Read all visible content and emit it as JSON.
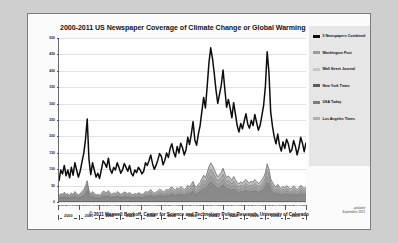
{
  "figure": {
    "title": "2000-2011 US Newspaper Coverage of Climate Change or Global Warming",
    "credit": "© 2011 Maxwell Boykoff, Center for Science and Technology Policy Research, University of Colorado",
    "updated_line1": "updated",
    "updated_line2": "September 2011"
  },
  "legend": {
    "items": [
      {
        "label": "5 Newspapers Combined",
        "color": "#0d0d0d"
      },
      {
        "label": "Washington Post",
        "color": "#9a9a9a"
      },
      {
        "label": "Wall Street Journal",
        "color": "#c8c8c8"
      },
      {
        "label": "New York Times",
        "color": "#5c5c5c"
      },
      {
        "label": "USA Today",
        "color": "#7e7e7e"
      },
      {
        "label": "Los Angeles Times",
        "color": "#b0b0b0"
      }
    ]
  },
  "chart_data": {
    "type": "line",
    "title": "2000-2011 US Newspaper Coverage of Climate Change or Global Warming",
    "xlabel": "",
    "ylabel": "Number of Articles",
    "ylim": [
      0,
      500
    ],
    "yticks": [
      0,
      50,
      100,
      150,
      200,
      250,
      300,
      350,
      400,
      450,
      500
    ],
    "grid": true,
    "legend_position": "right",
    "years": [
      "2000",
      "2001",
      "2002",
      "2003",
      "2004",
      "2005",
      "2006",
      "2007",
      "2008",
      "2009",
      "2010",
      "2011"
    ],
    "month_ticks": [
      "J",
      "F",
      "M",
      "A",
      "M",
      "J",
      "J",
      "A",
      "S",
      "O",
      "N",
      "D"
    ],
    "x_note": "Monthly observations, January 2000 through September 2011",
    "series": [
      {
        "name": "5 Newspapers Combined",
        "color": "#0d0d0d",
        "values": [
          62,
          96,
          84,
          110,
          78,
          96,
          72,
          104,
          80,
          118,
          96,
          74,
          92,
          120,
          146,
          188,
          252,
          128,
          82,
          118,
          96,
          74,
          86,
          70,
          96,
          124,
          116,
          104,
          132,
          98,
          86,
          104,
          96,
          118,
          104,
          86,
          96,
          116,
          104,
          92,
          110,
          86,
          78,
          96,
          88,
          104,
          96,
          84,
          92,
          118,
          110,
          124,
          142,
          116,
          98,
          110,
          126,
          146,
          138,
          112,
          126,
          148,
          134,
          162,
          176,
          150,
          136,
          168,
          148,
          178,
          164,
          142,
          158,
          196,
          174,
          206,
          244,
          188,
          172,
          206,
          232,
          276,
          318,
          286,
          352,
          424,
          470,
          438,
          392,
          340,
          300,
          328,
          356,
          402,
          344,
          288,
          312,
          286,
          256,
          302,
          268,
          232,
          212,
          238,
          222,
          246,
          268,
          236,
          224,
          248,
          232,
          266,
          242,
          218,
          232,
          262,
          294,
          352,
          458,
          396,
          274,
          230,
          198,
          176,
          206,
          172,
          154,
          182,
          162,
          190,
          176,
          150,
          158,
          186,
          168,
          142,
          164,
          196,
          178,
          152,
          180
        ]
      },
      {
        "name": "Washington Post",
        "color": "#9a9a9a",
        "values": [
          14,
          20,
          18,
          24,
          16,
          20,
          15,
          22,
          17,
          25,
          20,
          16,
          19,
          25,
          30,
          39,
          52,
          27,
          17,
          25,
          20,
          16,
          18,
          15,
          20,
          26,
          24,
          22,
          27,
          20,
          18,
          20,
          20,
          24,
          22,
          18,
          20,
          24,
          22,
          19,
          23,
          18,
          16,
          20,
          18,
          22,
          20,
          17,
          19,
          24,
          23,
          26,
          29,
          24,
          20,
          23,
          26,
          30,
          28,
          23,
          26,
          31,
          28,
          34,
          36,
          31,
          28,
          35,
          31,
          37,
          34,
          29,
          33,
          41,
          36,
          43,
          51,
          39,
          36,
          43,
          48,
          57,
          66,
          59,
          73,
          88,
          97,
          91,
          81,
          70,
          62,
          68,
          74,
          83,
          71,
          60,
          65,
          59,
          53,
          62,
          55,
          48,
          44,
          49,
          46,
          51,
          55,
          49,
          46,
          51,
          48,
          55,
          50,
          45,
          48,
          54,
          61,
          73,
          95,
          82,
          57,
          48,
          41,
          36,
          43,
          36,
          32,
          38,
          34,
          39,
          36,
          31,
          33,
          38,
          35,
          29,
          34,
          41,
          37,
          31,
          37
        ]
      },
      {
        "name": "Wall Street Journal",
        "color": "#c8c8c8",
        "values": [
          6,
          9,
          8,
          11,
          7,
          9,
          7,
          10,
          8,
          11,
          9,
          7,
          9,
          11,
          14,
          18,
          24,
          12,
          8,
          11,
          9,
          7,
          8,
          7,
          9,
          12,
          11,
          10,
          12,
          9,
          8,
          10,
          9,
          11,
          10,
          8,
          9,
          11,
          10,
          9,
          10,
          8,
          7,
          9,
          8,
          10,
          9,
          8,
          9,
          11,
          10,
          12,
          13,
          11,
          9,
          10,
          12,
          14,
          13,
          11,
          12,
          14,
          13,
          15,
          17,
          14,
          13,
          16,
          14,
          17,
          16,
          13,
          15,
          19,
          16,
          20,
          23,
          18,
          16,
          20,
          22,
          26,
          30,
          27,
          33,
          40,
          45,
          41,
          37,
          32,
          28,
          31,
          34,
          38,
          33,
          27,
          30,
          27,
          24,
          28,
          25,
          22,
          20,
          22,
          21,
          23,
          25,
          22,
          21,
          23,
          22,
          25,
          23,
          21,
          22,
          25,
          28,
          33,
          43,
          37,
          26,
          22,
          19,
          17,
          19,
          16,
          15,
          17,
          15,
          18,
          17,
          14,
          15,
          17,
          16,
          13,
          15,
          18,
          17,
          14,
          17
        ]
      },
      {
        "name": "New York Times",
        "color": "#5c5c5c",
        "values": [
          16,
          24,
          21,
          28,
          20,
          24,
          18,
          26,
          20,
          30,
          24,
          19,
          23,
          30,
          36,
          47,
          63,
          32,
          21,
          30,
          24,
          19,
          22,
          18,
          24,
          31,
          29,
          26,
          33,
          25,
          22,
          26,
          24,
          30,
          26,
          22,
          24,
          29,
          26,
          23,
          28,
          22,
          20,
          24,
          22,
          26,
          24,
          21,
          23,
          30,
          28,
          31,
          36,
          29,
          25,
          28,
          32,
          37,
          35,
          28,
          32,
          37,
          34,
          41,
          44,
          38,
          34,
          42,
          37,
          45,
          41,
          36,
          40,
          49,
          44,
          52,
          61,
          47,
          43,
          52,
          58,
          69,
          80,
          72,
          88,
          106,
          118,
          110,
          98,
          85,
          75,
          82,
          89,
          101,
          86,
          72,
          78,
          72,
          64,
          76,
          67,
          58,
          53,
          60,
          56,
          62,
          67,
          59,
          56,
          62,
          58,
          67,
          61,
          55,
          58,
          66,
          74,
          88,
          115,
          99,
          69,
          58,
          50,
          44,
          52,
          43,
          39,
          46,
          41,
          48,
          44,
          38,
          40,
          47,
          42,
          36,
          41,
          49,
          45,
          38,
          45
        ]
      },
      {
        "name": "USA Today",
        "color": "#7e7e7e",
        "values": [
          8,
          12,
          11,
          14,
          10,
          12,
          9,
          13,
          10,
          15,
          12,
          9,
          12,
          15,
          18,
          24,
          32,
          16,
          10,
          15,
          12,
          9,
          11,
          9,
          12,
          16,
          15,
          13,
          17,
          12,
          11,
          13,
          12,
          15,
          13,
          11,
          12,
          15,
          13,
          12,
          14,
          11,
          10,
          12,
          11,
          13,
          12,
          10,
          12,
          15,
          14,
          16,
          18,
          15,
          12,
          14,
          16,
          19,
          17,
          14,
          16,
          19,
          17,
          20,
          22,
          19,
          17,
          21,
          19,
          22,
          20,
          18,
          20,
          25,
          22,
          26,
          31,
          24,
          21,
          26,
          29,
          35,
          40,
          36,
          44,
          53,
          59,
          55,
          49,
          43,
          38,
          41,
          45,
          50,
          43,
          36,
          39,
          36,
          32,
          38,
          34,
          29,
          27,
          30,
          28,
          31,
          34,
          30,
          28,
          31,
          29,
          33,
          30,
          27,
          29,
          33,
          37,
          44,
          57,
          50,
          35,
          29,
          25,
          22,
          26,
          22,
          19,
          23,
          20,
          24,
          22,
          19,
          20,
          23,
          21,
          18,
          21,
          25,
          22,
          19,
          22
        ]
      },
      {
        "name": "Los Angeles Times",
        "color": "#b0b0b0",
        "values": [
          11,
          16,
          14,
          19,
          13,
          16,
          12,
          17,
          13,
          20,
          16,
          12,
          15,
          20,
          24,
          31,
          42,
          21,
          14,
          20,
          16,
          12,
          15,
          12,
          16,
          21,
          19,
          17,
          22,
          16,
          14,
          17,
          16,
          20,
          17,
          14,
          16,
          19,
          17,
          15,
          18,
          14,
          13,
          16,
          14,
          17,
          16,
          14,
          15,
          20,
          18,
          21,
          24,
          19,
          17,
          19,
          21,
          25,
          23,
          19,
          21,
          25,
          23,
          27,
          29,
          25,
          23,
          28,
          25,
          30,
          27,
          23,
          26,
          33,
          29,
          34,
          41,
          31,
          28,
          34,
          38,
          46,
          53,
          48,
          59,
          71,
          78,
          73,
          65,
          57,
          50,
          55,
          59,
          67,
          57,
          48,
          52,
          48,
          43,
          50,
          45,
          39,
          35,
          40,
          37,
          41,
          45,
          39,
          37,
          41,
          39,
          44,
          40,
          36,
          39,
          44,
          49,
          59,
          76,
          66,
          46,
          39,
          33,
          29,
          35,
          29,
          26,
          31,
          27,
          32,
          29,
          25,
          27,
          31,
          28,
          24,
          27,
          33,
          30,
          25,
          30
        ]
      }
    ]
  }
}
